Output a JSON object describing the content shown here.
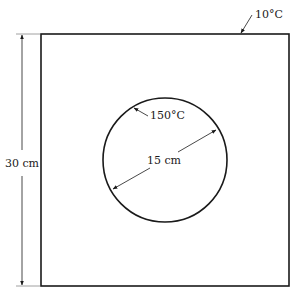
{
  "diagram": {
    "outer_square": {
      "side_label": "30 cm",
      "surface_temperature": "10°C"
    },
    "inner_circle": {
      "diameter_label": "15 cm",
      "surface_temperature": "150°C"
    },
    "colors": {
      "line": "#1a1a1a",
      "background": "#ffffff"
    }
  }
}
